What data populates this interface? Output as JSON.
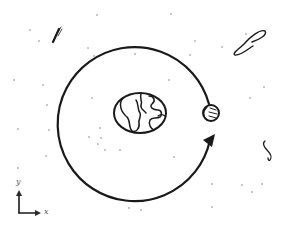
{
  "diagram": {
    "title": "",
    "colors": {
      "ink": "#1a1a1a",
      "star": "#6b6b6b",
      "background": "#ffffff",
      "axis": "#2a2a2a"
    },
    "orbit": {
      "cx": 139,
      "cy": 110,
      "r": 77,
      "direction": "counter-clockwise",
      "arrowhead_at": [
        210,
        140
      ]
    },
    "earth": {
      "label": "earth",
      "cx": 140,
      "cy": 113,
      "rx": 26,
      "ry": 20
    },
    "moon": {
      "label": "moon",
      "cx": 211,
      "cy": 113,
      "r": 8
    },
    "axes": {
      "x_label": "x",
      "y_label": "y",
      "origin": [
        20,
        213
      ]
    },
    "doodles": [
      {
        "name": "comet",
        "x": 55,
        "y": 35
      },
      {
        "name": "swoosh",
        "x": 250,
        "y": 40
      },
      {
        "name": "squiggle",
        "x": 268,
        "y": 150
      }
    ],
    "stars": [
      [
        30,
        30
      ],
      [
        39,
        41
      ],
      [
        14,
        80
      ],
      [
        43,
        85
      ],
      [
        97,
        15
      ],
      [
        88,
        48
      ],
      [
        94,
        56
      ],
      [
        135,
        54
      ],
      [
        171,
        14
      ],
      [
        92,
        98
      ],
      [
        100,
        128
      ],
      [
        89,
        137
      ],
      [
        101,
        138
      ],
      [
        105,
        150
      ],
      [
        49,
        130
      ],
      [
        18,
        168
      ],
      [
        46,
        156
      ],
      [
        18,
        129
      ],
      [
        129,
        208
      ],
      [
        174,
        157
      ],
      [
        222,
        47
      ],
      [
        246,
        34
      ],
      [
        169,
        80
      ],
      [
        250,
        98
      ],
      [
        264,
        87
      ],
      [
        242,
        185
      ],
      [
        252,
        192
      ],
      [
        262,
        184
      ],
      [
        212,
        184
      ],
      [
        212,
        207
      ],
      [
        47,
        105
      ],
      [
        120,
        150
      ],
      [
        195,
        41
      ],
      [
        190,
        55
      ],
      [
        98,
        144
      ],
      [
        141,
        210
      ]
    ]
  }
}
